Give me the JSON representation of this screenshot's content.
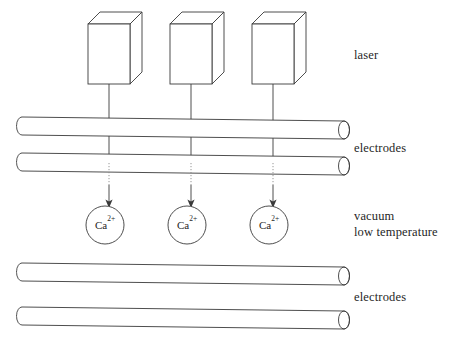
{
  "figure": {
    "background_color": "#ffffff",
    "line_color": "#3a3a3a",
    "hidden_line_color": "#9a9a9a",
    "text_color": "#1f1f1f"
  },
  "labels": {
    "laser": "laser",
    "electrodes_upper": "electrodes",
    "vacuum": "vacuum",
    "low_temperature": "low temperature",
    "electrodes_lower": "electrodes"
  },
  "lasers": [
    {
      "name": "laser-box-1",
      "front_x": 88,
      "front_y": 24,
      "width": 42,
      "height": 60,
      "depth": 12
    },
    {
      "name": "laser-box-2",
      "front_x": 170,
      "front_y": 24,
      "width": 42,
      "height": 60,
      "depth": 12
    },
    {
      "name": "laser-box-3",
      "front_x": 252,
      "front_y": 24,
      "width": 42,
      "height": 60,
      "depth": 12
    }
  ],
  "beams": [
    {
      "name": "beam-1",
      "x": 109,
      "y_start": 84,
      "y_end": 206
    },
    {
      "name": "beam-2",
      "x": 191,
      "y_start": 84,
      "y_end": 206
    },
    {
      "name": "beam-3",
      "x": 273,
      "y_start": 84,
      "y_end": 206
    }
  ],
  "electrodes": [
    {
      "name": "electrode-top-1",
      "x1": 22,
      "y1": 126,
      "x2": 344,
      "y2": 130,
      "radius": 9
    },
    {
      "name": "electrode-top-2",
      "x1": 22,
      "y1": 162,
      "x2": 344,
      "y2": 166,
      "radius": 9
    },
    {
      "name": "electrode-bottom-1",
      "x1": 22,
      "y1": 272,
      "x2": 344,
      "y2": 276,
      "radius": 9
    },
    {
      "name": "electrode-bottom-2",
      "x1": 22,
      "y1": 316,
      "x2": 344,
      "y2": 320,
      "radius": 9
    }
  ],
  "ions": [
    {
      "name": "ion-1",
      "cx": 105,
      "cy": 225,
      "r": 19,
      "element": "Ca",
      "charge": "2+"
    },
    {
      "name": "ion-2",
      "cx": 187,
      "cy": 225,
      "r": 19,
      "element": "Ca",
      "charge": "2+"
    },
    {
      "name": "ion-3",
      "cx": 269,
      "cy": 225,
      "r": 19,
      "element": "Ca",
      "charge": "2+"
    }
  ],
  "label_positions": {
    "laser": {
      "x": 354,
      "y": 59
    },
    "electrodes_upper": {
      "x": 354,
      "y": 152
    },
    "vacuum": {
      "x": 354,
      "y": 220
    },
    "low_temperature": {
      "x": 354,
      "y": 236
    },
    "electrodes_lower": {
      "x": 354,
      "y": 301
    }
  }
}
